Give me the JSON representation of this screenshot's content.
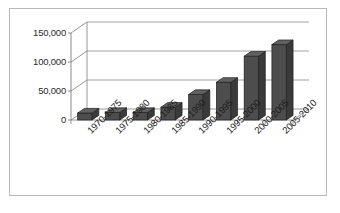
{
  "chart_data": {
    "type": "bar",
    "title": "",
    "subtitle": "",
    "xlabel": "",
    "ylabel": "",
    "categories": [
      "1970-1975",
      "1975-1980",
      "1980-1985",
      "1985-1990",
      "1990-1995",
      "1995-2000",
      "2000-2005",
      "2005-2010"
    ],
    "values": [
      12000,
      13000,
      13000,
      22000,
      44000,
      65000,
      110000,
      130000
    ],
    "ylim": [
      0,
      150000
    ],
    "ytick_values": [
      0,
      50000,
      100000,
      150000
    ],
    "ytick_labels": [
      "0",
      "50,000",
      "100,000",
      "150,000"
    ],
    "grid": true,
    "legend": false,
    "legend_position": "none",
    "series": [
      {
        "name": "",
        "values": [
          12000,
          13000,
          13000,
          22000,
          44000,
          65000,
          110000,
          130000
        ]
      }
    ],
    "style": {
      "three_d": true,
      "bar_face_color": "#4d4d4d",
      "bar_side_color": "#3a3a3a",
      "bar_top_color": "#616161",
      "bar_edge_color": "#1f1f1f",
      "grid_color": "#8c8c8c",
      "axis_color": "#7d7d7d",
      "border_color": "#b9b9b9",
      "background_color": "#ffffff",
      "label_color": "#1c1c1c",
      "x_label_rotation": -45
    }
  }
}
